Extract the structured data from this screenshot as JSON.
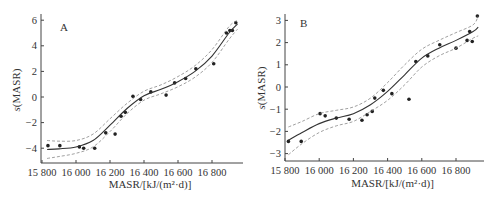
{
  "chart_data": [
    {
      "type": "scatter",
      "panel_label": "A",
      "title": "",
      "xlabel": "MASR/[kJ/(m²·d)]",
      "ylabel": "s(MASR)",
      "xlim": [
        15780,
        16980
      ],
      "ylim": [
        -5.2,
        6
      ],
      "x_ticks": [
        15800,
        16000,
        16200,
        16400,
        16600,
        16800
      ],
      "x_tick_labels": [
        "15 800",
        "16 000",
        "16 200",
        "16 400",
        "16 600",
        "16 800"
      ],
      "y_ticks": [
        6,
        4,
        2,
        0,
        -2,
        -4
      ],
      "y_tick_labels": [
        "6",
        "4",
        "2",
        "0",
        "−2",
        "−4"
      ],
      "grid": false,
      "legend": null,
      "series": [
        {
          "name": "observations",
          "style": "points",
          "x": [
            15835,
            15905,
            16020,
            16045,
            16110,
            16175,
            16230,
            16265,
            16290,
            16335,
            16380,
            16440,
            16530,
            16580,
            16645,
            16705,
            16810,
            16885,
            16905,
            16920,
            16940
          ],
          "y": [
            -3.8,
            -3.8,
            -3.9,
            -4.0,
            -4.0,
            -2.8,
            -2.9,
            -1.5,
            -1.2,
            0.05,
            -0.2,
            0.4,
            0.15,
            1.1,
            1.45,
            2.2,
            2.6,
            5.0,
            5.2,
            5.2,
            5.8
          ]
        },
        {
          "name": "smooth fit",
          "style": "solid",
          "x": [
            15830,
            15900,
            16000,
            16100,
            16200,
            16300,
            16400,
            16500,
            16600,
            16700,
            16800,
            16900,
            16950
          ],
          "y": [
            -4.1,
            -4.05,
            -3.9,
            -3.4,
            -2.2,
            -0.9,
            0.1,
            0.6,
            1.2,
            2.0,
            3.2,
            5.0,
            5.7
          ]
        },
        {
          "name": "upper confidence band",
          "style": "dashed",
          "x": [
            15830,
            15900,
            16000,
            16100,
            16200,
            16300,
            16400,
            16500,
            16600,
            16700,
            16800,
            16900,
            16950
          ],
          "y": [
            -3.4,
            -3.45,
            -3.4,
            -2.9,
            -1.7,
            -0.5,
            0.45,
            0.95,
            1.6,
            2.45,
            3.7,
            5.5,
            6.0
          ]
        },
        {
          "name": "lower confidence band",
          "style": "dashed",
          "x": [
            15830,
            15900,
            16000,
            16100,
            16200,
            16300,
            16400,
            16500,
            16600,
            16700,
            16800,
            16900,
            16950
          ],
          "y": [
            -4.8,
            -4.65,
            -4.4,
            -3.9,
            -2.7,
            -1.3,
            -0.25,
            0.25,
            0.8,
            1.55,
            2.7,
            4.5,
            5.3
          ]
        }
      ]
    },
    {
      "type": "scatter",
      "panel_label": "B",
      "title": "",
      "xlabel": "MASR/[kJ/(m²·d)]",
      "ylabel": "s(MASR)",
      "xlim": [
        15800,
        16960
      ],
      "ylim": [
        -3.3,
        3
      ],
      "x_ticks": [
        15800,
        16000,
        16200,
        16400,
        16600,
        16800
      ],
      "x_tick_labels": [
        "15 800",
        "16 000",
        "16 200",
        "16 400",
        "16 600",
        "16 800"
      ],
      "y_ticks": [
        3,
        2,
        1,
        0,
        -1,
        -2,
        -3
      ],
      "y_tick_labels": [
        "3",
        "2",
        "1",
        "0",
        "−1",
        "−2",
        "−3"
      ],
      "grid": false,
      "legend": null,
      "series": [
        {
          "name": "observations",
          "style": "points",
          "x": [
            15820,
            15895,
            16005,
            16035,
            16100,
            16175,
            16250,
            16280,
            16310,
            16325,
            16375,
            16425,
            16525,
            16565,
            16635,
            16705,
            16800,
            16865,
            16880,
            16895,
            16925
          ],
          "y": [
            -2.45,
            -2.45,
            -1.2,
            -1.3,
            -1.4,
            -1.45,
            -1.5,
            -1.25,
            -1.1,
            -0.5,
            -0.15,
            -0.3,
            -0.55,
            1.15,
            1.4,
            1.9,
            1.75,
            2.1,
            2.5,
            2.05,
            3.2
          ]
        },
        {
          "name": "smooth fit",
          "style": "solid",
          "x": [
            15820,
            15900,
            16000,
            16100,
            16200,
            16300,
            16400,
            16500,
            16600,
            16700,
            16800,
            16900,
            16930
          ],
          "y": [
            -2.4,
            -2.05,
            -1.65,
            -1.4,
            -1.2,
            -0.8,
            -0.2,
            0.55,
            1.3,
            1.75,
            2.1,
            2.5,
            2.7
          ]
        },
        {
          "name": "upper confidence band",
          "style": "dashed",
          "x": [
            15820,
            15900,
            16000,
            16100,
            16200,
            16300,
            16400,
            16500,
            16600,
            16700,
            16800,
            16900,
            16930
          ],
          "y": [
            -1.8,
            -1.55,
            -1.2,
            -1.05,
            -0.9,
            -0.5,
            0.2,
            1.0,
            1.7,
            2.1,
            2.45,
            2.8,
            3.2
          ]
        },
        {
          "name": "lower confidence band",
          "style": "dashed",
          "x": [
            15820,
            15900,
            16000,
            16100,
            16200,
            16300,
            16400,
            16500,
            16600,
            16700,
            16800,
            16900,
            16930
          ],
          "y": [
            -3.05,
            -2.55,
            -2.05,
            -1.75,
            -1.55,
            -1.1,
            -0.6,
            0.1,
            0.9,
            1.4,
            1.75,
            2.2,
            2.3
          ]
        }
      ]
    }
  ]
}
